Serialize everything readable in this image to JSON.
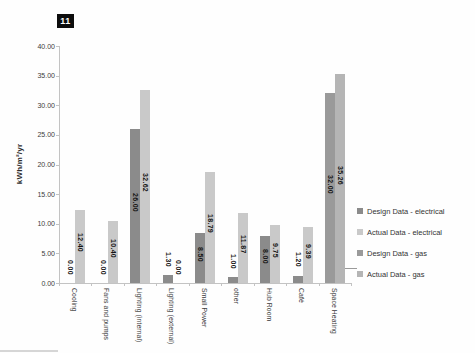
{
  "page": {
    "badge": "11"
  },
  "chart_data": {
    "type": "bar",
    "title": "",
    "xlabel": "",
    "ylabel": "kWh/m²/yr",
    "ylim": [
      0,
      40
    ],
    "ytick_step": 5,
    "ytick_labels": [
      "0.00",
      "5.00",
      "10.00",
      "15.00",
      "20.00",
      "25.00",
      "30.00",
      "35.00",
      "40.00"
    ],
    "grid": false,
    "legend_position": "right",
    "categories": [
      "Cooling",
      "Fans and pumps",
      "Lighting (internal)",
      "Lighting (external)",
      "Small Power",
      "other",
      "Hub Room",
      "Café",
      "Space Heating"
    ],
    "series": [
      {
        "name": "Design Data - electrical",
        "color": "#8b8b8b",
        "slot": "left",
        "values": [
          0.0,
          0.0,
          26.0,
          1.3,
          8.5,
          1.0,
          8.0,
          1.2,
          null
        ]
      },
      {
        "name": "Actual Data - electrical",
        "color": "#c9c9c9",
        "slot": "right",
        "values": [
          12.4,
          10.4,
          32.62,
          0.0,
          18.79,
          11.87,
          9.75,
          9.39,
          null
        ]
      },
      {
        "name": "Design Data - gas",
        "color": "#9a9a9a",
        "slot": "left",
        "values": [
          null,
          null,
          null,
          null,
          null,
          null,
          null,
          null,
          32.0
        ]
      },
      {
        "name": "Actual Data - gas",
        "color": "#b5b5b5",
        "slot": "right",
        "values": [
          null,
          null,
          null,
          null,
          null,
          null,
          null,
          null,
          35.26
        ]
      }
    ],
    "value_label_format": "2dp"
  }
}
